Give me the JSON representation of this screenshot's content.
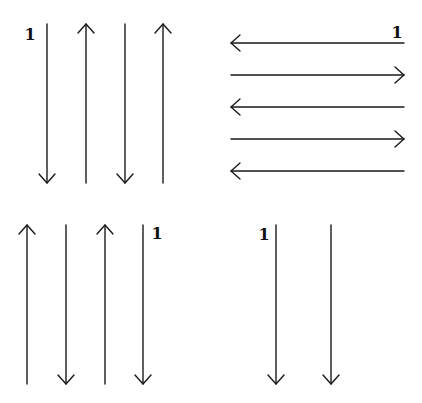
{
  "diagram": {
    "stroke_color": "#1a1a1a",
    "panels": [
      {
        "name": "top-left",
        "orientation": "vertical",
        "label": "1",
        "label_pos": [
          30,
          40
        ],
        "span": [
          24,
          183
        ],
        "arrows": [
          {
            "pos": 47,
            "direction": "down"
          },
          {
            "pos": 86,
            "direction": "up"
          },
          {
            "pos": 125,
            "direction": "down"
          },
          {
            "pos": 163,
            "direction": "up"
          }
        ]
      },
      {
        "name": "top-right",
        "orientation": "horizontal",
        "label": "1",
        "label_pos": [
          397,
          38
        ],
        "span": [
          231,
          404
        ],
        "arrows": [
          {
            "pos": 43,
            "direction": "left"
          },
          {
            "pos": 75,
            "direction": "right"
          },
          {
            "pos": 107,
            "direction": "left"
          },
          {
            "pos": 139,
            "direction": "right"
          },
          {
            "pos": 171,
            "direction": "left"
          }
        ]
      },
      {
        "name": "bottom-left",
        "orientation": "vertical",
        "label": "1",
        "label_pos": [
          157,
          239
        ],
        "span": [
          225,
          384
        ],
        "arrows": [
          {
            "pos": 27,
            "direction": "up"
          },
          {
            "pos": 66,
            "direction": "down"
          },
          {
            "pos": 105,
            "direction": "up"
          },
          {
            "pos": 143,
            "direction": "down"
          }
        ]
      },
      {
        "name": "bottom-right",
        "orientation": "vertical",
        "label": "1",
        "label_pos": [
          264,
          240
        ],
        "span": [
          225,
          384
        ],
        "arrows": [
          {
            "pos": 276,
            "direction": "down"
          },
          {
            "pos": 331,
            "direction": "down"
          }
        ]
      }
    ]
  }
}
